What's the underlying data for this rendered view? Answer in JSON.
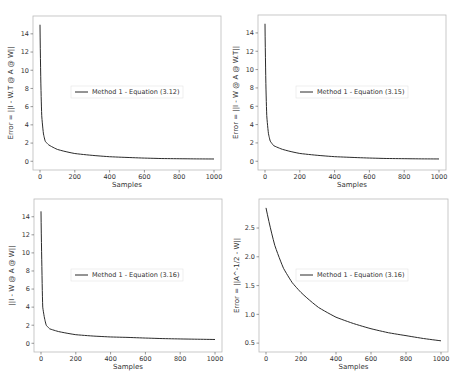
{
  "chart_data": [
    {
      "type": "line",
      "title": "",
      "xlabel": "Samples",
      "ylabel": "Error = ||I - W.T @ A @ W||",
      "xlim": [
        0,
        1000
      ],
      "ylim": [
        0,
        15
      ],
      "xticks": [
        "0",
        "200",
        "400",
        "600",
        "800",
        "1000"
      ],
      "yticks": [
        "0",
        "2",
        "4",
        "6",
        "8",
        "10",
        "12",
        "14"
      ],
      "legend_position": "center",
      "grid": false,
      "series": [
        {
          "name": "Method 1 - Equation (3.12)",
          "x": [
            0,
            5,
            10,
            20,
            30,
            50,
            100,
            200,
            300,
            400,
            500,
            600,
            700,
            800,
            900,
            1000
          ],
          "y": [
            15.0,
            8.5,
            5.0,
            3.0,
            2.2,
            1.8,
            1.3,
            0.85,
            0.65,
            0.5,
            0.42,
            0.35,
            0.3,
            0.28,
            0.26,
            0.25
          ]
        }
      ]
    },
    {
      "type": "line",
      "title": "",
      "xlabel": "Samples",
      "ylabel": "Error = ||I - W @ A @ W.T||",
      "xlim": [
        0,
        1000
      ],
      "ylim": [
        0,
        15
      ],
      "xticks": [
        "0",
        "200",
        "400",
        "600",
        "800",
        "1000"
      ],
      "yticks": [
        "0",
        "2",
        "4",
        "6",
        "8",
        "10",
        "12",
        "14"
      ],
      "legend_position": "center",
      "grid": false,
      "series": [
        {
          "name": "Method 1 - Equation (3.15)",
          "x": [
            0,
            5,
            10,
            20,
            30,
            50,
            100,
            200,
            300,
            400,
            500,
            600,
            700,
            800,
            900,
            1000
          ],
          "y": [
            15.0,
            8.5,
            5.0,
            3.0,
            2.2,
            1.7,
            1.3,
            0.85,
            0.65,
            0.5,
            0.42,
            0.35,
            0.3,
            0.28,
            0.26,
            0.25
          ]
        }
      ]
    },
    {
      "type": "line",
      "title": "",
      "xlabel": "Samples",
      "ylabel": "||I - W @ A @ W||",
      "xlim": [
        0,
        1000
      ],
      "ylim": [
        0,
        15
      ],
      "xticks": [
        "0",
        "200",
        "400",
        "600",
        "800",
        "1000"
      ],
      "yticks": [
        "0",
        "2",
        "4",
        "6",
        "8",
        "10",
        "12",
        "14"
      ],
      "legend_position": "center",
      "grid": false,
      "series": [
        {
          "name": "Method 1 - Equation (3.16)",
          "x": [
            0,
            5,
            10,
            20,
            30,
            50,
            100,
            200,
            300,
            400,
            500,
            600,
            700,
            800,
            900,
            1000
          ],
          "y": [
            14.6,
            8.5,
            4.0,
            2.8,
            2.0,
            1.6,
            1.3,
            0.95,
            0.8,
            0.7,
            0.65,
            0.58,
            0.52,
            0.48,
            0.45,
            0.42
          ]
        }
      ]
    },
    {
      "type": "line",
      "title": "",
      "xlabel": "Samples",
      "ylabel": "Error = ||A^-1/2 - W||",
      "xlim": [
        0,
        1000
      ],
      "ylim": [
        0.45,
        2.9
      ],
      "xticks": [
        "0",
        "200",
        "400",
        "600",
        "800",
        "1000"
      ],
      "yticks": [
        "0.5",
        "1.0",
        "1.5",
        "2.0",
        "2.5"
      ],
      "legend_position": "center",
      "grid": false,
      "series": [
        {
          "name": "Method 1 - Equation (3.16)",
          "x": [
            0,
            50,
            100,
            150,
            200,
            300,
            400,
            500,
            600,
            700,
            800,
            900,
            1000
          ],
          "y": [
            2.85,
            2.2,
            1.8,
            1.55,
            1.38,
            1.12,
            0.95,
            0.84,
            0.75,
            0.68,
            0.63,
            0.58,
            0.54
          ]
        }
      ]
    }
  ],
  "panels": [
    {
      "legend": "Method 1 - Equation (3.12)",
      "xlabel": "Samples",
      "ylabel": "Error = ||I - W.T @ A @ W||"
    },
    {
      "legend": "Method 1 - Equation (3.15)",
      "xlabel": "Samples",
      "ylabel": "Error = ||I - W @ A @ W.T||"
    },
    {
      "legend": "Method 1 - Equation (3.16)",
      "xlabel": "Samples",
      "ylabel": "||I - W @ A @ W||"
    },
    {
      "legend": "Method 1 - Equation (3.16)",
      "xlabel": "Samples",
      "ylabel": "Error = ||A^-1/2 - W||"
    }
  ]
}
